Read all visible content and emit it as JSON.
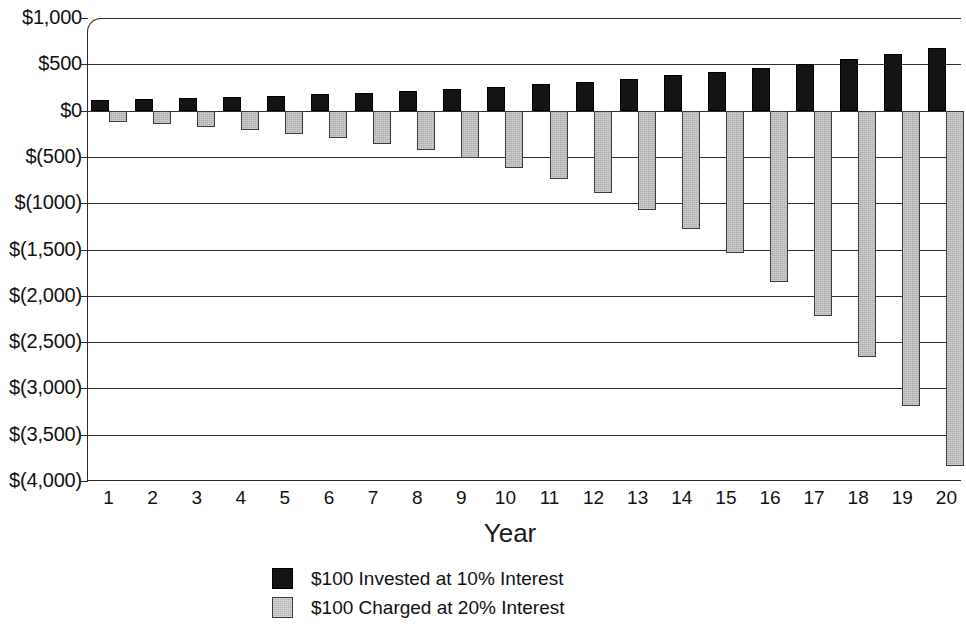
{
  "chart_data": {
    "type": "bar",
    "title": "",
    "subtitle": "",
    "xlabel": "Year",
    "ylabel": "",
    "categories": [
      "1",
      "2",
      "3",
      "4",
      "5",
      "6",
      "7",
      "8",
      "9",
      "10",
      "11",
      "12",
      "13",
      "14",
      "15",
      "16",
      "17",
      "18",
      "19",
      "20"
    ],
    "ytick_labels": [
      "$1,000",
      "$500",
      "$0",
      "$(500)",
      "$(1000)",
      "$(1,500)",
      "$(2,000)",
      "$(2,500)",
      "$(3,000)",
      "$(3,500)",
      "$(4,000)"
    ],
    "ytick_values": [
      1000,
      500,
      0,
      -500,
      -1000,
      -1500,
      -2000,
      -2500,
      -3000,
      -3500,
      -4000
    ],
    "ylim": [
      -4000,
      1000
    ],
    "grid": true,
    "legend_position": "bottom",
    "series": [
      {
        "name": "$100 Invested at 10% Interest",
        "color": "#141414",
        "values": [
          110,
          121,
          133,
          146,
          161,
          177,
          195,
          214,
          236,
          259,
          285,
          314,
          345,
          380,
          418,
          459,
          505,
          556,
          612,
          673
        ]
      },
      {
        "name": "$100 Charged at 20% Interest",
        "color": "#ababab",
        "values": [
          -120,
          -144,
          -173,
          -207,
          -249,
          -299,
          -358,
          -430,
          -516,
          -619,
          -743,
          -892,
          -1070,
          -1284,
          -1541,
          -1849,
          -2219,
          -2663,
          -3195,
          -3834
        ]
      }
    ]
  },
  "legend": {
    "items": [
      {
        "label": "$100 Invested at 10% Interest",
        "swatch": "black-square"
      },
      {
        "label": "$100 Charged at 20% Interest",
        "swatch": "gray-square"
      }
    ]
  },
  "axis": {
    "x_title": "Year"
  }
}
